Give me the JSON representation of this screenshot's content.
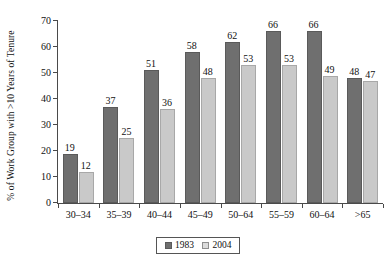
{
  "chart_data": {
    "type": "bar",
    "title": "",
    "xlabel": "",
    "ylabel": "% of Work Group with >10 Years of Tenure",
    "ylim": [
      0,
      70
    ],
    "yticks": [
      0,
      10,
      20,
      30,
      40,
      50,
      60,
      70
    ],
    "grid": false,
    "legend_position": "bottom-center",
    "categories": [
      "30–34",
      "35–39",
      "40–44",
      "45–49",
      "50–64",
      "55–59",
      "60–64",
      ">65"
    ],
    "series": [
      {
        "name": "1983",
        "color": "#6f6f6f",
        "values": [
          19,
          37,
          51,
          58,
          62,
          66,
          66,
          48
        ]
      },
      {
        "name": "2004",
        "color": "#c9c9c9",
        "values": [
          12,
          25,
          36,
          48,
          53,
          53,
          49,
          47
        ]
      }
    ]
  },
  "legend": {
    "items": [
      {
        "label": "1983"
      },
      {
        "label": "2004"
      }
    ]
  }
}
